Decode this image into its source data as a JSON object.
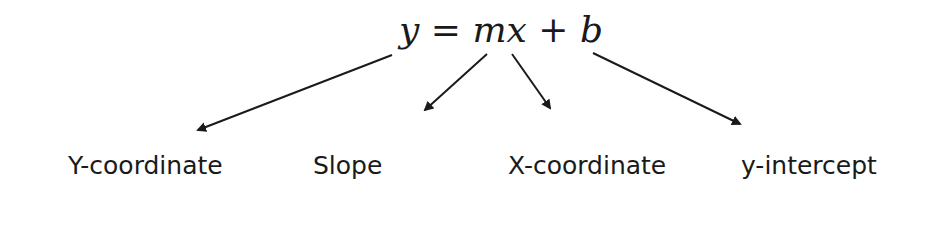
{
  "diagram": {
    "equation": "y = mx + b",
    "labels": [
      {
        "text": "Y-coordinate",
        "x": 68
      },
      {
        "text": "Slope",
        "x": 313
      },
      {
        "text": "X-coordinate",
        "x": 508
      },
      {
        "text": "y-intercept",
        "x": 741
      }
    ],
    "arrows": [
      {
        "from": [
          392,
          55
        ],
        "to": [
          198,
          130
        ],
        "target": "Y-coordinate"
      },
      {
        "from": [
          487,
          54
        ],
        "to": [
          425,
          110
        ],
        "target": "Slope"
      },
      {
        "from": [
          512,
          54
        ],
        "to": [
          550,
          108
        ],
        "target": "X-coordinate"
      },
      {
        "from": [
          593,
          53
        ],
        "to": [
          740,
          124
        ],
        "target": "y-intercept"
      }
    ],
    "colors": {
      "ink": "#1a1a1a",
      "background": "#ffffff"
    }
  }
}
